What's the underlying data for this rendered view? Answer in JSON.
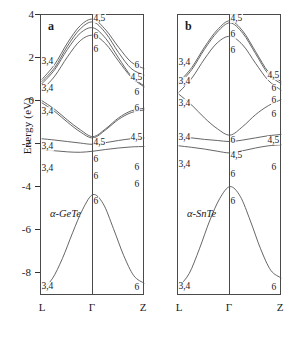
{
  "figure": {
    "axis_label": "Energy (eV)",
    "y_ticks": [
      "4",
      "2",
      "0",
      "-2",
      "-4",
      "-6",
      "-8"
    ],
    "y_values": [
      4,
      2,
      0,
      -2,
      -4,
      -6,
      -8
    ],
    "x_ticks": [
      "L",
      "Γ",
      "Z"
    ]
  },
  "panels": [
    {
      "tag": "a",
      "material": "α-GeTe",
      "labels_left": [
        "3,4",
        "3,4",
        "3,4",
        "3,4",
        "3,4",
        "3,4"
      ],
      "labels_center": [
        "4,5",
        "6",
        "6",
        "4,5",
        "6",
        "6",
        "6"
      ],
      "labels_right": [
        "6",
        "4,5",
        "6",
        "6",
        "4,5",
        "6",
        "6",
        "6"
      ]
    },
    {
      "tag": "b",
      "material": "α-SnTe",
      "labels_left": [
        "3,4",
        "3,4",
        "3,4",
        "3,4",
        "3,4",
        "3,4"
      ],
      "labels_center": [
        "4,5",
        "6",
        "6",
        "6",
        "4,5",
        "6",
        "6"
      ],
      "labels_right": [
        "4,5",
        "6",
        "6",
        "6",
        "4,5",
        "6",
        "6"
      ]
    }
  ],
  "chart_data": {
    "type": "line",
    "title": "",
    "xlabel": "",
    "ylabel": "Energy (eV)",
    "ylim": [
      -9,
      4
    ],
    "xlim": [
      0,
      2
    ],
    "x_tick_labels": [
      "L",
      "Γ",
      "Z"
    ],
    "x_tick_positions": [
      0,
      1,
      2
    ],
    "grid": false,
    "legend": "none",
    "subplots": [
      {
        "tag": "a",
        "material": "α-GeTe",
        "series": [
          {
            "name": "cond-1",
            "rep_L": "3,4",
            "rep_G": "4,5",
            "rep_Z": "6",
            "points": [
              [
                0,
                1.05
              ],
              [
                0.25,
                1.75
              ],
              [
                0.5,
                2.75
              ],
              [
                0.75,
                3.55
              ],
              [
                1.0,
                3.85
              ],
              [
                1.25,
                3.35
              ],
              [
                1.5,
                2.55
              ],
              [
                1.75,
                1.85
              ],
              [
                2.0,
                1.55
              ]
            ]
          },
          {
            "name": "cond-2",
            "rep_L": "3,4",
            "rep_G": "4,5",
            "rep_Z": "4,5",
            "points": [
              [
                0,
                0.95
              ],
              [
                0.25,
                1.6
              ],
              [
                0.5,
                2.6
              ],
              [
                0.75,
                3.4
              ],
              [
                1.0,
                3.72
              ],
              [
                1.25,
                3.2
              ],
              [
                1.5,
                2.3
              ],
              [
                1.75,
                1.55
              ],
              [
                2.0,
                1.25
              ]
            ]
          },
          {
            "name": "cond-3",
            "rep_L": "3,4",
            "rep_G": "6",
            "rep_Z": "6",
            "points": [
              [
                0,
                0.85
              ],
              [
                0.25,
                1.5
              ],
              [
                0.5,
                2.45
              ],
              [
                0.75,
                3.2
              ],
              [
                1.0,
                3.45
              ],
              [
                1.25,
                2.95
              ],
              [
                1.5,
                2.05
              ],
              [
                1.75,
                1.2
              ],
              [
                2.0,
                0.75
              ]
            ]
          },
          {
            "name": "cond-4",
            "rep_L": "3,4",
            "rep_G": "6",
            "rep_Z": "6",
            "points": [
              [
                0,
                0.55
              ],
              [
                0.25,
                1.2
              ],
              [
                0.5,
                2.1
              ],
              [
                0.75,
                2.85
              ],
              [
                1.0,
                3.1
              ],
              [
                1.25,
                2.7
              ],
              [
                1.5,
                1.9
              ],
              [
                1.75,
                1.15
              ],
              [
                2.0,
                0.7
              ]
            ]
          },
          {
            "name": "val-1",
            "rep_L": "3,4",
            "rep_G": "4,5",
            "rep_Z": "4,5",
            "points": [
              [
                0,
                0.05
              ],
              [
                0.25,
                -0.35
              ],
              [
                0.5,
                -0.85
              ],
              [
                0.75,
                -1.3
              ],
              [
                1.0,
                -1.62
              ],
              [
                1.25,
                -1.25
              ],
              [
                1.5,
                -0.75
              ],
              [
                1.75,
                -0.42
              ],
              [
                2.0,
                -0.3
              ]
            ]
          },
          {
            "name": "val-2",
            "rep_L": "3,4",
            "rep_G": "4,5",
            "rep_Z": "-",
            "points": [
              [
                0,
                -0.05
              ],
              [
                0.25,
                -0.45
              ],
              [
                0.5,
                -0.95
              ],
              [
                0.75,
                -1.4
              ],
              [
                1.0,
                -1.68
              ],
              [
                1.25,
                -1.3
              ],
              [
                1.5,
                -0.82
              ],
              [
                1.75,
                -0.5
              ],
              [
                2.0,
                -0.38
              ]
            ]
          },
          {
            "name": "val-3",
            "rep_L": "3,4",
            "rep_G": "6",
            "rep_Z": "6",
            "points": [
              [
                0,
                -1.72
              ],
              [
                0.25,
                -1.78
              ],
              [
                0.5,
                -1.85
              ],
              [
                0.75,
                -1.92
              ],
              [
                1.0,
                -1.98
              ],
              [
                1.25,
                -1.9
              ],
              [
                1.5,
                -1.8
              ],
              [
                1.75,
                -1.72
              ],
              [
                2.0,
                -1.68
              ]
            ]
          },
          {
            "name": "val-4",
            "rep_L": "3,4",
            "rep_G": "6",
            "rep_Z": "6",
            "points": [
              [
                0,
                -2.22
              ],
              [
                0.25,
                -2.28
              ],
              [
                0.5,
                -2.33
              ],
              [
                0.75,
                -2.35
              ],
              [
                1.0,
                -2.3
              ],
              [
                1.25,
                -2.22
              ],
              [
                1.5,
                -2.15
              ],
              [
                1.75,
                -2.1
              ],
              [
                2.0,
                -2.08
              ]
            ]
          },
          {
            "name": "deep-1",
            "rep_L": "3,4",
            "rep_G": "6",
            "rep_Z": "6",
            "points": [
              [
                0,
                -8.75
              ],
              [
                0.2,
                -8.25
              ],
              [
                0.4,
                -7.3
              ],
              [
                0.6,
                -6.1
              ],
              [
                0.8,
                -5.0
              ],
              [
                1.0,
                -4.32
              ],
              [
                1.2,
                -4.75
              ],
              [
                1.4,
                -5.9
              ],
              [
                1.6,
                -7.15
              ],
              [
                1.8,
                -8.1
              ],
              [
                2.0,
                -8.45
              ]
            ]
          }
        ]
      },
      {
        "tag": "b",
        "material": "α-SnTe",
        "series": [
          {
            "name": "cond-1",
            "rep_L": "3,4",
            "rep_G": "4,5",
            "rep_Z": "4,5",
            "points": [
              [
                0,
                0.92
              ],
              [
                0.25,
                1.6
              ],
              [
                0.5,
                2.55
              ],
              [
                0.75,
                3.35
              ],
              [
                1.0,
                3.78
              ],
              [
                1.25,
                3.3
              ],
              [
                1.5,
                2.35
              ],
              [
                1.75,
                1.4
              ],
              [
                2.0,
                0.95
              ]
            ]
          },
          {
            "name": "cond-2",
            "rep_L": "3,4",
            "rep_G": "4,5",
            "rep_Z": "4,5",
            "points": [
              [
                0,
                0.82
              ],
              [
                0.25,
                1.5
              ],
              [
                0.5,
                2.45
              ],
              [
                0.75,
                3.25
              ],
              [
                1.0,
                3.68
              ],
              [
                1.25,
                3.2
              ],
              [
                1.5,
                2.25
              ],
              [
                1.75,
                1.3
              ],
              [
                2.0,
                0.85
              ]
            ]
          },
          {
            "name": "cond-3",
            "rep_L": "3,4",
            "rep_G": "6",
            "rep_Z": "6",
            "points": [
              [
                0,
                0.45
              ],
              [
                0.25,
                1.1
              ],
              [
                0.5,
                2.0
              ],
              [
                0.75,
                2.75
              ],
              [
                1.0,
                3.05
              ],
              [
                1.25,
                2.65
              ],
              [
                1.5,
                1.8
              ],
              [
                1.75,
                1.0
              ],
              [
                2.0,
                0.55
              ]
            ]
          },
          {
            "name": "val-1",
            "rep_L": "3,4",
            "rep_G": "6",
            "rep_Z": "6",
            "points": [
              [
                0,
                0.35
              ],
              [
                0.25,
                -0.15
              ],
              [
                0.5,
                -0.75
              ],
              [
                0.75,
                -1.25
              ],
              [
                1.0,
                -1.55
              ],
              [
                1.25,
                -1.15
              ],
              [
                1.5,
                -0.6
              ],
              [
                1.75,
                -0.18
              ],
              [
                2.0,
                0.1
              ]
            ]
          },
          {
            "name": "val-2",
            "rep_L": "3,4",
            "rep_G": "6",
            "rep_Z": "4,5",
            "points": [
              [
                0,
                -1.62
              ],
              [
                0.25,
                -1.68
              ],
              [
                0.5,
                -1.75
              ],
              [
                0.75,
                -1.8
              ],
              [
                1.0,
                -1.85
              ],
              [
                1.25,
                -1.78
              ],
              [
                1.5,
                -1.68
              ],
              [
                1.75,
                -1.58
              ],
              [
                2.0,
                -1.52
              ]
            ]
          },
          {
            "name": "val-3",
            "rep_L": "3,4",
            "rep_G": "4,5",
            "rep_Z": "6",
            "points": [
              [
                0,
                -2.05
              ],
              [
                0.25,
                -2.12
              ],
              [
                0.5,
                -2.2
              ],
              [
                0.75,
                -2.3
              ],
              [
                1.0,
                -2.38
              ],
              [
                1.25,
                -2.28
              ],
              [
                1.5,
                -2.15
              ],
              [
                1.75,
                -2.05
              ],
              [
                2.0,
                -2.0
              ]
            ]
          },
          {
            "name": "deep-1",
            "rep_L": "3,4",
            "rep_G": "6",
            "rep_Z": "6",
            "points": [
              [
                0,
                -8.6
              ],
              [
                0.2,
                -8.0
              ],
              [
                0.4,
                -6.85
              ],
              [
                0.6,
                -5.55
              ],
              [
                0.8,
                -4.5
              ],
              [
                1.0,
                -3.95
              ],
              [
                1.2,
                -4.4
              ],
              [
                1.4,
                -5.55
              ],
              [
                1.6,
                -6.85
              ],
              [
                1.8,
                -7.85
              ],
              [
                2.0,
                -8.2
              ]
            ]
          }
        ]
      }
    ]
  }
}
